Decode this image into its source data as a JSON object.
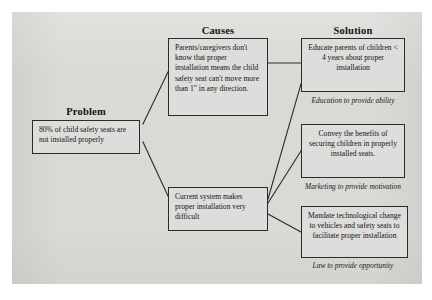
{
  "diagram": {
    "headings": {
      "problem": "Problem",
      "causes": "Causes",
      "solution": "Solution"
    },
    "problem": {
      "text": "80% of child safety seats are not installed properly"
    },
    "causes": [
      {
        "id": "cause-knowledge",
        "text": "Parents/caregivers don't know that proper installation means the child safety seat can't move more than 1\" in any direction."
      },
      {
        "id": "cause-system",
        "text": "Current system makes proper installation very difficult"
      }
    ],
    "solutions": [
      {
        "id": "solution-education",
        "text": "Educate parents of children < 4 years about proper installation",
        "caption": "Education to provide ability"
      },
      {
        "id": "solution-marketing",
        "text": "Convey the benefits of securing children in properly installed seats.",
        "caption": "Marketing to provide motivation"
      },
      {
        "id": "solution-law",
        "text": "Mandate technological change to vehicles and safety seats to facilitate proper installation",
        "caption": "Law to provide opportunity"
      }
    ],
    "connectors": [
      {
        "id": "problem-to-cause-knowledge",
        "from": "problem",
        "to": "cause-knowledge"
      },
      {
        "id": "problem-to-cause-system",
        "from": "problem",
        "to": "cause-system"
      },
      {
        "id": "cause-knowledge-to-solution-education",
        "from": "cause-knowledge",
        "to": "solution-education"
      },
      {
        "id": "cause-system-to-solution-education",
        "from": "cause-system",
        "to": "solution-education"
      },
      {
        "id": "cause-system-to-solution-marketing",
        "from": "cause-system",
        "to": "solution-marketing"
      },
      {
        "id": "cause-system-to-solution-law",
        "from": "cause-system",
        "to": "solution-law"
      }
    ],
    "colors": {
      "panel_background": "#d9d9d6",
      "box_fill": "#dddddb",
      "box_border": "#2b2b2b",
      "text": "#141414",
      "page_background": "#ffffff"
    }
  }
}
